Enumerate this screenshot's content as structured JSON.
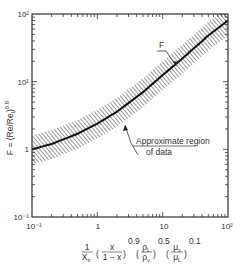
{
  "chart_data": {
    "type": "line",
    "title": "",
    "xlabel": "1/X_tt (x/(1-x))^0.9 (rho_L/rho_v)^0.5 (mu_v/mu_L)^0.1",
    "ylabel": "F = (Re/Re_l)^0.8",
    "xscale": "log",
    "yscale": "log",
    "xlim": [
      0.1,
      100
    ],
    "ylim": [
      0.1,
      100
    ],
    "x_tick_labels": [
      "10⁻¹",
      "1",
      "10",
      "10²"
    ],
    "y_tick_labels": [
      "10⁻¹",
      "1",
      "10¹",
      "10²"
    ],
    "grid": false,
    "series": [
      {
        "name": "F",
        "x": [
          0.1,
          0.2,
          0.5,
          1,
          2,
          5,
          10,
          20,
          50,
          100
        ],
        "values": [
          1.0,
          1.2,
          1.7,
          2.4,
          3.6,
          7.0,
          12.5,
          22,
          48,
          80
        ]
      }
    ],
    "band": {
      "name": "Approximate region of data",
      "lower_factor": 0.6,
      "upper_factor": 1.6
    },
    "annotations": [
      {
        "text": "F",
        "target": "curve"
      },
      {
        "text": "Approximate region",
        "line2": "of data",
        "target": "hatched band"
      }
    ]
  },
  "labels": {
    "y_axis_F": "F = (Re/Re",
    "y_axis_sub": "l",
    "y_axis_end": ")",
    "y_axis_exp": "0.8",
    "curve_label": "F",
    "region_line1": "Approximate region",
    "region_line2": "of data",
    "x_axis_frac_num": "1",
    "x_axis_frac_den": "X",
    "x_axis_frac_den_sub": "tt",
    "x_axis_t1_num": "x",
    "x_axis_t1_den": "1 − x",
    "x_axis_t1_exp": "0.9",
    "x_axis_t2_num": "ρ",
    "x_axis_t2_num_sub": "L",
    "x_axis_t2_den": "ρ",
    "x_axis_t2_den_sub": "v",
    "x_axis_t2_exp": "0.5",
    "x_axis_t3_num": "μ",
    "x_axis_t3_num_sub": "v",
    "x_axis_t3_den": "μ",
    "x_axis_t3_den_sub": "L",
    "x_axis_t3_exp": "0.1"
  }
}
